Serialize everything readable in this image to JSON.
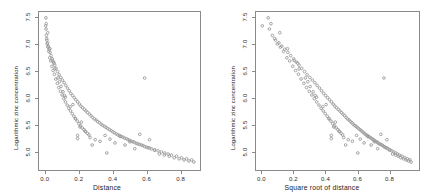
{
  "figure": {
    "background": "#ffffff",
    "point_color": "#9a9a9a",
    "frame_color": "#8a8a8a"
  },
  "chart_data": [
    {
      "type": "scatter",
      "panel": "left",
      "title": "",
      "xlabel": "Distance",
      "ylabel": "Logarithmic zinc concentration",
      "xlim": [
        -0.04,
        0.92
      ],
      "ylim": [
        4.65,
        7.62
      ],
      "xticks": [
        "0.0",
        "0.2",
        "0.4",
        "0.6",
        "0.8"
      ],
      "xtick_values": [
        0.0,
        0.2,
        0.4,
        0.6,
        0.8
      ],
      "yticks": [
        "5.0",
        "5.5",
        "6.0",
        "6.5",
        "7.0",
        "7.5"
      ],
      "ytick_values": [
        5.0,
        5.5,
        6.0,
        6.5,
        7.0,
        7.5
      ],
      "grid": false,
      "legend": "none",
      "marker": "open-circle",
      "n_points": 155,
      "x": [
        0.00136,
        0.01222,
        0.10303,
        0.19009,
        0.27709,
        0.36407,
        0.19009,
        0.09125,
        0.16234,
        0.21256,
        0.07395,
        0.11185,
        0.05416,
        0.04048,
        0.02522,
        0.04969,
        0.08274,
        0.11728,
        0.14595,
        0.17715,
        0.20413,
        0.23458,
        0.26441,
        0.29479,
        0.32374,
        0.35412,
        0.38318,
        0.41335,
        0.44292,
        0.47268,
        0.50144,
        0.53109,
        0.56082,
        0.58993,
        0.61911,
        0.64873,
        0.67817,
        0.70754,
        0.73686,
        0.76622,
        0.79549,
        0.82479,
        0.85407,
        0.88336,
        0.0,
        0.002,
        0.004,
        0.007,
        0.011,
        0.015,
        0.02,
        0.026,
        0.032,
        0.039,
        0.046,
        0.054,
        0.062,
        0.071,
        0.08,
        0.09,
        0.1,
        0.11,
        0.12,
        0.13,
        0.14,
        0.15,
        0.16,
        0.17,
        0.18,
        0.19,
        0.2,
        0.21,
        0.22,
        0.23,
        0.24,
        0.25,
        0.26,
        0.27,
        0.28,
        0.29,
        0.3,
        0.31,
        0.32,
        0.33,
        0.34,
        0.35,
        0.36,
        0.37,
        0.38,
        0.39,
        0.4,
        0.41,
        0.42,
        0.43,
        0.44,
        0.45,
        0.46,
        0.47,
        0.48,
        0.49,
        0.5,
        0.51,
        0.52,
        0.53,
        0.54,
        0.55,
        0.56,
        0.57,
        0.58,
        0.59,
        0.6,
        0.61,
        0.62,
        0.63,
        0.65,
        0.67,
        0.69,
        0.71,
        0.73,
        0.75,
        0.78,
        0.81,
        0.84,
        0.87,
        0.003,
        0.006,
        0.009,
        0.013,
        0.018,
        0.024,
        0.03,
        0.037,
        0.044,
        0.052,
        0.06,
        0.069,
        0.078,
        0.088,
        0.098,
        0.108,
        0.118,
        0.128,
        0.138,
        0.148,
        0.158,
        0.168,
        0.178,
        0.188,
        0.198,
        0.208,
        0.218,
        0.228,
        0.238,
        0.248,
        0.258
      ],
      "y": [
        7.51,
        7.23,
        6.12,
        5.3,
        5.12,
        4.97,
        5.24,
        6.22,
        5.88,
        5.55,
        6.38,
        6.05,
        6.55,
        6.71,
        6.93,
        6.66,
        6.31,
        6.02,
        5.84,
        5.62,
        5.46,
        5.38,
        5.26,
        5.22,
        5.19,
        5.3,
        5.23,
        5.16,
        5.28,
        5.12,
        5.18,
        5.05,
        5.32,
        6.38,
        5.22,
        5.02,
        4.95,
        4.93,
        4.91,
        4.88,
        4.86,
        4.84,
        4.82,
        4.8,
        7.36,
        7.3,
        7.18,
        7.09,
        7.04,
        6.98,
        6.92,
        6.86,
        6.8,
        6.74,
        6.68,
        6.62,
        6.56,
        6.5,
        6.44,
        6.39,
        6.34,
        6.29,
        6.24,
        6.19,
        6.14,
        6.09,
        6.05,
        6.01,
        5.97,
        5.93,
        5.89,
        5.85,
        5.82,
        5.79,
        5.76,
        5.73,
        5.7,
        5.67,
        5.64,
        5.61,
        5.59,
        5.56,
        5.54,
        5.51,
        5.49,
        5.47,
        5.45,
        5.43,
        5.41,
        5.39,
        5.37,
        5.35,
        5.33,
        5.31,
        5.3,
        5.28,
        5.27,
        5.25,
        5.24,
        5.22,
        5.21,
        5.19,
        5.18,
        5.17,
        5.15,
        5.14,
        5.13,
        5.12,
        5.11,
        5.09,
        5.08,
        5.07,
        5.06,
        5.05,
        5.03,
        5.01,
        4.99,
        4.97,
        4.95,
        4.93,
        4.91,
        4.88,
        4.86,
        4.84,
        7.4,
        7.12,
        7.02,
        6.96,
        6.88,
        6.76,
        6.7,
        6.6,
        6.52,
        6.45,
        6.36,
        6.28,
        6.2,
        6.13,
        6.06,
        5.99,
        5.93,
        5.87,
        5.81,
        5.76,
        5.71,
        5.66,
        5.61,
        5.57,
        5.52,
        5.48,
        5.44,
        5.41,
        5.37,
        5.34,
        5.31
      ]
    },
    {
      "type": "scatter",
      "panel": "right",
      "title": "",
      "xlabel": "Square root of distance",
      "ylabel": "Logarithmic zinc concentration",
      "xlim": [
        -0.04,
        0.99
      ],
      "ylim": [
        4.65,
        7.62
      ],
      "xticks": [
        "0.0",
        "0.2",
        "0.4",
        "0.6",
        "0.8"
      ],
      "xtick_values": [
        0.0,
        0.2,
        0.4,
        0.6,
        0.8
      ],
      "yticks": [
        "5.0",
        "5.5",
        "6.0",
        "6.5",
        "7.0",
        "7.5"
      ],
      "ytick_values": [
        5.0,
        5.5,
        6.0,
        6.5,
        7.0,
        7.5
      ],
      "grid": false,
      "legend": "none",
      "marker": "open-circle",
      "n_points": 155,
      "note": "x values are the square roots of the left panel x values"
    }
  ]
}
